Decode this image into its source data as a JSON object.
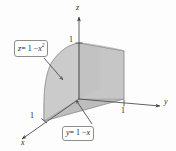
{
  "figure": {
    "kind": "3d-solid-diagram",
    "background": "#fdfdfd",
    "stroke": "#6f6f6f"
  },
  "axes": {
    "x": {
      "label": "x",
      "tick_label": "1"
    },
    "y": {
      "label": "y",
      "tick_label": "1"
    },
    "z": {
      "label": "z",
      "tick_label": "1"
    }
  },
  "callouts": {
    "surface_z": {
      "text": "z = 1 − x²",
      "lhs": "z",
      "eq": "= 1 −",
      "var": "x",
      "exp": "2"
    },
    "plane_y": {
      "text": "y = 1 − x",
      "lhs": "y",
      "eq": "= 1 −",
      "var": "x"
    }
  },
  "surfaces": {
    "top_face": "#cfcfcf",
    "right_face": "#c6c6c6",
    "back_face": "#b4b4b4",
    "front_face": "#d4d4d4",
    "base_face": "#bdbdbd",
    "curved_face": "#c9c9c9"
  }
}
